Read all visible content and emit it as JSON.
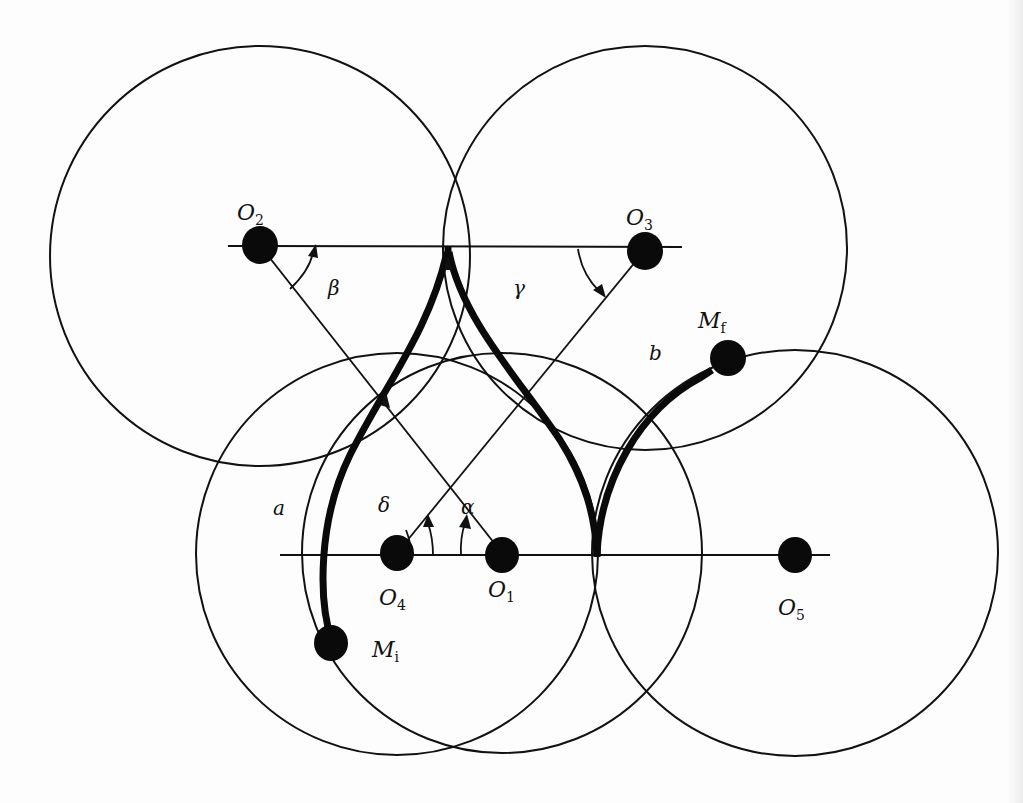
{
  "figure": {
    "nodes": [
      {
        "id": "O1",
        "main": "O",
        "sub": "1",
        "x": 502,
        "y": 553,
        "radius": 200
      },
      {
        "id": "O2",
        "main": "O",
        "sub": "2",
        "x": 260,
        "y": 245,
        "radius": 212
      },
      {
        "id": "O3",
        "main": "O",
        "sub": "3",
        "x": 645,
        "y": 250,
        "radius": 202
      },
      {
        "id": "O4",
        "main": "O",
        "sub": "4",
        "x": 397,
        "y": 553,
        "radius": 200
      },
      {
        "id": "O5",
        "main": "O",
        "sub": "5",
        "x": 795,
        "y": 553,
        "radius": 202
      }
    ],
    "endpoints": [
      {
        "id": "Mi",
        "main": "M",
        "sub": "i",
        "role": "initial"
      },
      {
        "id": "Mf",
        "main": "M",
        "sub": "f",
        "role": "final"
      }
    ],
    "angles": [
      {
        "id": "alpha",
        "symbol": "α"
      },
      {
        "id": "beta",
        "symbol": "β"
      },
      {
        "id": "gamma",
        "symbol": "γ"
      },
      {
        "id": "delta",
        "symbol": "δ"
      }
    ],
    "segments": [
      {
        "id": "a",
        "label": "a"
      },
      {
        "id": "b",
        "label": "b"
      }
    ],
    "colors": {
      "ink": "#111111",
      "paper": "#fdfdfd"
    }
  }
}
